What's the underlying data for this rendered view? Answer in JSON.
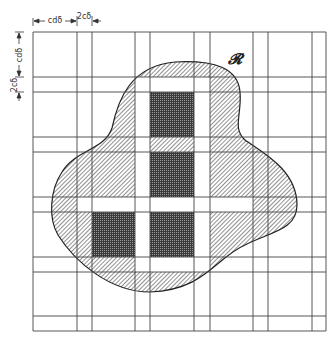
{
  "figure": {
    "region_label": "𝓡",
    "dim_top_1": "cdδ",
    "dim_top_2": "2cδ",
    "dim_left_1": "cdδ",
    "dim_left_2": "2cδ"
  },
  "colors": {
    "grid": "#444444",
    "hatch": "#555555",
    "dark": "#3a3a3a",
    "background": "#ffffff"
  },
  "grid": {
    "vertical_lines_x": [
      33,
      77,
      92,
      135,
      150,
      194,
      210,
      253,
      268,
      312,
      326
    ],
    "horizontal_lines_y": [
      32,
      77,
      92,
      137,
      152,
      197,
      212,
      257,
      272,
      316,
      331
    ]
  }
}
